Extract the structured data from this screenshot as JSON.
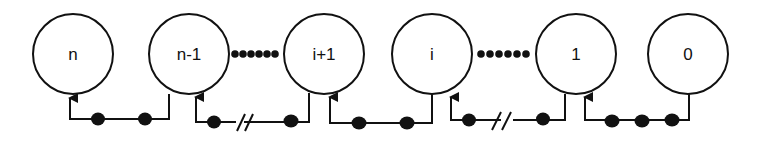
{
  "diagram": {
    "nodes": [
      {
        "label": "n",
        "cx": 73,
        "cy": 54
      },
      {
        "label": "n-1",
        "cx": 189,
        "cy": 54
      },
      {
        "label": "i+1",
        "cx": 324,
        "cy": 54
      },
      {
        "label": "i",
        "cx": 432,
        "cy": 54
      },
      {
        "label": "1",
        "cx": 576,
        "cy": 54
      },
      {
        "label": "0",
        "cx": 688,
        "cy": 54
      }
    ],
    "ellipsis_between": [
      [
        "n-1",
        "i+1"
      ],
      [
        "i",
        "1"
      ]
    ],
    "links": [
      {
        "from": "n-1",
        "to": "n",
        "tokens": 2,
        "broken": false
      },
      {
        "from": "i+1",
        "to": "n-1",
        "tokens": 2,
        "broken": true
      },
      {
        "from": "i",
        "to": "i+1",
        "tokens": 2,
        "broken": false
      },
      {
        "from": "1",
        "to": "i",
        "tokens": 2,
        "broken": true
      },
      {
        "from": "0",
        "to": "1",
        "tokens": 3,
        "broken": false
      }
    ],
    "colors": {
      "stroke": "#111111",
      "background": "#ffffff"
    }
  }
}
